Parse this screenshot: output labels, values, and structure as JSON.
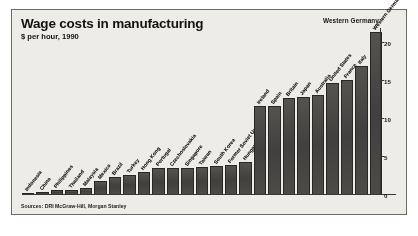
{
  "figure": {
    "title": "Wage costs in manufacturing",
    "subtitle": "$ per hour, 1990",
    "callout": "Western Germany",
    "source": "Sources: DRI McGraw-Hill, Morgan Stanley"
  },
  "chart_data": {
    "type": "bar",
    "title": "Wage costs in manufacturing",
    "subtitle": "$ per hour, 1990",
    "xlabel": "",
    "ylabel": "$ per hour",
    "ylim": [
      0,
      22
    ],
    "yticks": [
      0,
      5,
      10,
      15,
      20
    ],
    "ytick_labels": [
      "0",
      "5",
      "10",
      "15",
      "20"
    ],
    "axis_position": "right",
    "grid": false,
    "legend": null,
    "annotations": [
      {
        "text": "Western Germany",
        "target": "Western Germany",
        "position": "top-right"
      }
    ],
    "source": "Sources: DRI McGraw-Hill, Morgan Stanley",
    "categories": [
      "Indonesia",
      "China",
      "Philippines",
      "Thailand",
      "Malaysia",
      "Mexico",
      "Brazil",
      "Turkey",
      "Hong Kong",
      "Portugal",
      "Czechoslovakia",
      "Singapore",
      "Taiwan",
      "South Korea",
      "Former Soviet Union",
      "Hungary",
      "Ireland",
      "Spain",
      "Britain",
      "Japan",
      "Australia",
      "United States",
      "France",
      "Italy",
      "Western Germany"
    ],
    "values": [
      0.3,
      0.4,
      0.6,
      0.7,
      0.9,
      1.8,
      2.4,
      2.6,
      3.0,
      3.5,
      3.6,
      3.6,
      3.7,
      3.8,
      3.9,
      4.3,
      11.7,
      11.7,
      12.8,
      12.9,
      13.2,
      14.8,
      15.2,
      17.0,
      21.5
    ]
  }
}
